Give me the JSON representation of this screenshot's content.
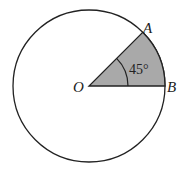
{
  "diagram": {
    "type": "circle-sector",
    "labels": {
      "center": "O",
      "point_a": "A",
      "point_b": "B",
      "angle": "45°"
    },
    "colors": {
      "sector_fill": "#a9a9a9",
      "stroke": "#222222",
      "background": "#ffffff"
    }
  }
}
